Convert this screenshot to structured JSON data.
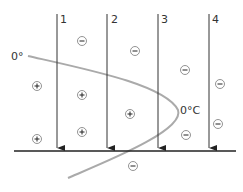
{
  "diagram": {
    "line_labels": [
      "1",
      "2",
      "3",
      "4"
    ],
    "isotherm_labels": {
      "left": "0°",
      "right": "0°C"
    },
    "colors": {
      "lines": "#333333",
      "isotherm": "#aaaaaa",
      "charge": "#555555"
    },
    "negative_charges": [
      [
        82,
        41
      ],
      [
        135,
        51
      ],
      [
        185,
        70
      ],
      [
        220,
        84
      ],
      [
        218,
        124
      ],
      [
        186,
        135
      ],
      [
        133,
        166
      ]
    ],
    "positive_charges": [
      [
        37,
        86
      ],
      [
        82,
        95
      ],
      [
        82,
        132
      ],
      [
        37,
        139
      ],
      [
        130,
        114
      ]
    ]
  }
}
